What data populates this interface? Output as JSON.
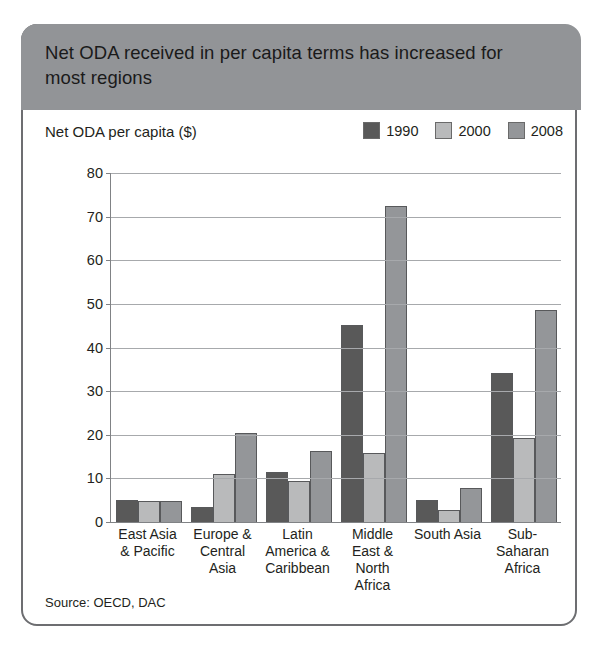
{
  "header": {
    "title": "Net ODA received in per capita terms has increased for most regions"
  },
  "source": {
    "text": "Source: OECD, DAC"
  },
  "legend": {
    "position": "top-right",
    "items": [
      {
        "label": "1990",
        "color": "#595959"
      },
      {
        "label": "2000",
        "color": "#b9babb"
      },
      {
        "label": "2008",
        "color": "#949699"
      }
    ]
  },
  "chart_data": {
    "type": "bar",
    "title": "Net ODA received in per capita terms has increased for most regions",
    "subtitle": "",
    "xlabel": "",
    "ylabel": "Net ODA per capita ($)",
    "ylim": [
      0,
      80
    ],
    "yticks": [
      0,
      10,
      20,
      30,
      40,
      50,
      60,
      70,
      80
    ],
    "grid": true,
    "categories": [
      "East Asia & Pacific",
      "Europe & Central Asia",
      "Latin America & Caribbean",
      "Middle East & North Africa",
      "South Asia",
      "Sub-Saharan Africa"
    ],
    "series": [
      {
        "name": "1990",
        "color": "#595959",
        "values": [
          5.0,
          3.5,
          11.5,
          45.2,
          5.1,
          34.2
        ]
      },
      {
        "name": "2000",
        "color": "#b9babb",
        "values": [
          4.9,
          11.1,
          9.5,
          15.8,
          2.7,
          19.3
        ]
      },
      {
        "name": "2008",
        "color": "#949699",
        "values": [
          4.9,
          20.4,
          16.2,
          72.4,
          7.9,
          48.5
        ]
      }
    ],
    "annotations": [],
    "source": "Source: OECD, DAC"
  }
}
